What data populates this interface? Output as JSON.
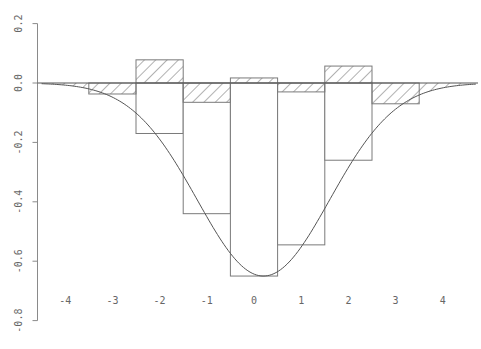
{
  "chart_data": {
    "type": "bar",
    "title": "",
    "xlabel": "",
    "ylabel": "",
    "xlim": [
      -4.6,
      4.8
    ],
    "ylim": [
      -0.8,
      0.2
    ],
    "x_ticks": [
      -4,
      -3,
      -2,
      -1,
      0,
      1,
      2,
      3,
      4
    ],
    "y_ticks": [
      0.2,
      0.0,
      -0.2,
      -0.4,
      -0.6,
      -0.8
    ],
    "y_tick_labels": [
      "0.2",
      "0.0",
      "-0.2",
      "-0.4",
      "-0.6",
      "-0.8"
    ],
    "grid": false,
    "legend": null,
    "bin_width": 1,
    "series": [
      {
        "name": "histogram bars (white)",
        "categories": [
          -2,
          -1,
          0,
          1,
          2
        ],
        "values": [
          -0.17,
          -0.44,
          -0.65,
          -0.545,
          -0.26
        ]
      },
      {
        "name": "residual bars (hatched)",
        "categories": [
          -3,
          -2,
          -1,
          0,
          1,
          2,
          3
        ],
        "values": [
          -0.037,
          0.078,
          -0.065,
          0.017,
          -0.03,
          0.057,
          -0.07
        ]
      },
      {
        "name": "fitted curve",
        "type": "line",
        "shape": "gaussian",
        "amplitude": -0.65,
        "center": 0.2,
        "sigma": 1.4,
        "x_range": [
          -4.5,
          4.7
        ]
      }
    ]
  },
  "layout": {
    "px_origin_x": 254,
    "px_per_unit_x": 47.2,
    "px_origin_y": 83,
    "px_per_unit_y": 297
  }
}
